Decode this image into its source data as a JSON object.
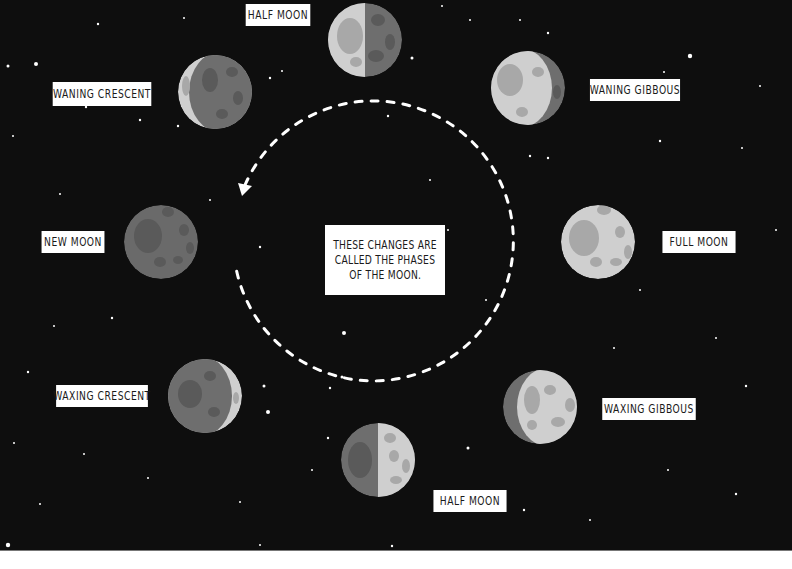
{
  "diagram": {
    "title": "Phases of the Moon",
    "center_text": [
      "THESE CHANGES ARE",
      "CALLED THE PHASES",
      "OF THE MOON."
    ],
    "phases": [
      {
        "id": "half-moon-top",
        "label": "HALF MOON"
      },
      {
        "id": "waning-gibbous",
        "label": "WANING GIBBOUS"
      },
      {
        "id": "full-moon",
        "label": "FULL MOON"
      },
      {
        "id": "waxing-gibbous",
        "label": "WAXING GIBBOUS"
      },
      {
        "id": "half-moon-bottom",
        "label": "HALF MOON"
      },
      {
        "id": "waxing-crescent",
        "label": "WAXING CRESCENT"
      },
      {
        "id": "new-moon",
        "label": "NEW MOON"
      },
      {
        "id": "waning-crescent",
        "label": "WANING CRESCENT"
      }
    ],
    "colors": {
      "background": "#0e0e0e",
      "moon_light": "#cfcfcf",
      "moon_dark": "#6e6e6e",
      "crater_light": "#a8a8a8",
      "crater_dark": "#5a5a5a",
      "label_bg": "#ffffff",
      "label_text": "#1a1a1a",
      "orbit_line": "#ffffff"
    }
  }
}
